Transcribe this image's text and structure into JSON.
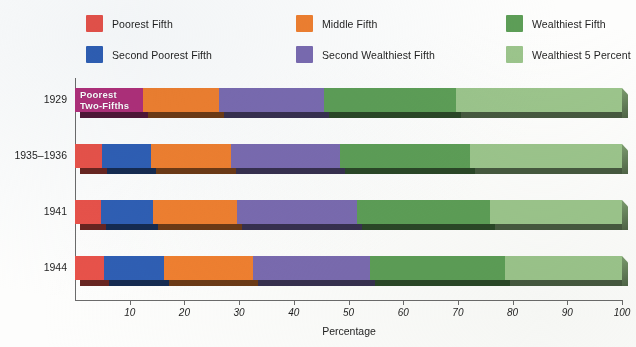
{
  "legend": {
    "items": [
      {
        "label": "Poorest Fifth",
        "color": "#e8524a",
        "key": "poorest_fifth"
      },
      {
        "label": "Middle Fifth",
        "color": "#f08030",
        "key": "middle_fifth"
      },
      {
        "label": "Wealthiest Fifth",
        "color": "#5d9e57",
        "key": "wealthiest_fifth"
      },
      {
        "label": "Second Poorest Fifth",
        "color": "#2f5fb4",
        "key": "second_poorest_fifth"
      },
      {
        "label": "Second Wealthiest Fifth",
        "color": "#7a6bb0",
        "key": "second_wealthiest_fifth"
      },
      {
        "label": "Wealthiest 5 Percent",
        "color": "#9cc58c",
        "key": "wealthiest_5_percent"
      }
    ]
  },
  "annotation": {
    "poorest_two_fifths": "Poorest\nTwo-Fifths",
    "poorest_two_fifths_color": "#b0307a"
  },
  "chart_data": {
    "type": "bar",
    "orientation": "horizontal",
    "stacked": true,
    "title": "",
    "xlabel": "Percentage",
    "ylabel": "",
    "xlim": [
      0,
      100
    ],
    "xticks": [
      10,
      20,
      30,
      40,
      50,
      60,
      70,
      80,
      90,
      100
    ],
    "grid": false,
    "legend_position": "top",
    "categories": [
      "1929",
      "1935–1936",
      "1941",
      "1944"
    ],
    "series": [
      {
        "name": "Poorest Fifth",
        "color": "#e8524a",
        "values": [
          null,
          4.9,
          4.8,
          5.3
        ]
      },
      {
        "name": "Second Poorest Fifth",
        "color": "#2f5fb4",
        "values": [
          null,
          9.0,
          9.5,
          11.0
        ]
      },
      {
        "name": "Poorest Two-Fifths",
        "color": "#b0307a",
        "values": [
          12.5,
          null,
          null,
          null
        ]
      },
      {
        "name": "Middle Fifth",
        "color": "#f08030",
        "values": [
          13.8,
          14.6,
          15.3,
          16.2
        ]
      },
      {
        "name": "Second Wealthiest Fifth",
        "color": "#7a6bb0",
        "values": [
          19.3,
          19.9,
          22.0,
          21.4
        ]
      },
      {
        "name": "Wealthiest Fifth",
        "color": "#5d9e57",
        "values": [
          24.1,
          23.8,
          24.3,
          24.7
        ]
      },
      {
        "name": "Wealthiest 5 Percent",
        "color": "#9cc58c",
        "values": [
          30.3,
          27.8,
          24.1,
          21.4
        ]
      }
    ],
    "cumulative_boundaries": {
      "1929": [
        12.5,
        26.3,
        45.6,
        69.7,
        100
      ],
      "1935–1936": [
        4.9,
        13.9,
        28.5,
        48.4,
        72.2,
        100
      ],
      "1941": [
        4.8,
        14.3,
        29.6,
        51.6,
        75.7,
        100
      ],
      "1944": [
        5.3,
        16.3,
        32.5,
        53.9,
        78.6,
        100
      ]
    }
  }
}
